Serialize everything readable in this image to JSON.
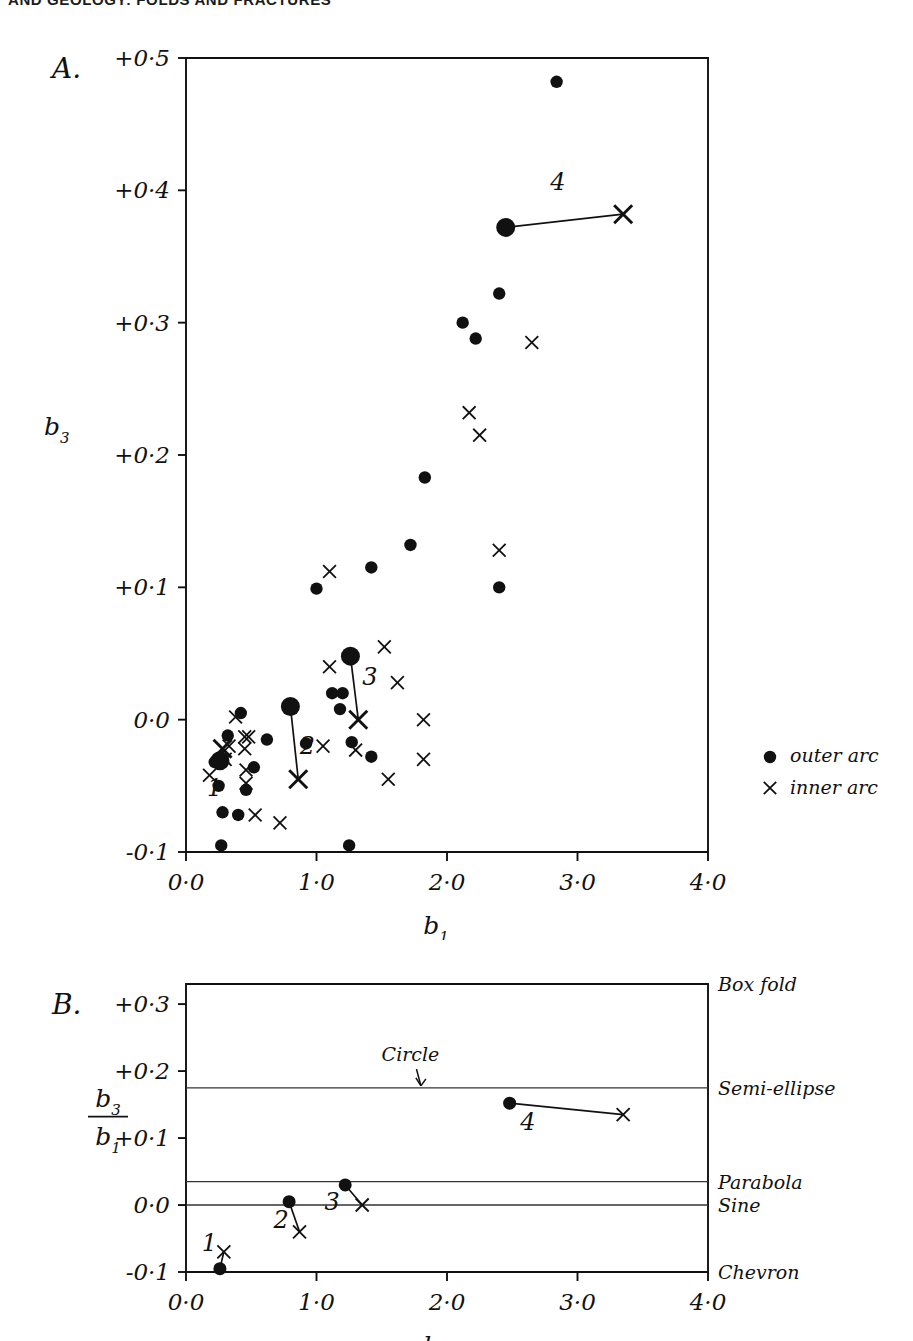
{
  "running_head": "AND GEOLOGY: FOLDS AND FRACTURES",
  "panelA": {
    "label": "A.",
    "ylabel": "b",
    "ylabel_sub": "3",
    "xlabel": "b",
    "xlabel_sub": "1",
    "yticks": [
      "+0·5",
      "+0·4",
      "+0·3",
      "+0·2",
      "+0·1",
      "0·0",
      "-0·1"
    ],
    "ytick_values": [
      0.5,
      0.4,
      0.3,
      0.2,
      0.1,
      0.0,
      -0.1
    ],
    "xticks": [
      "0·0",
      "1·0",
      "2·0",
      "3·0",
      "4·0"
    ],
    "xtick_values": [
      0.0,
      1.0,
      2.0,
      3.0,
      4.0
    ],
    "legend": [
      {
        "marker": "dot",
        "label": "outer arc"
      },
      {
        "marker": "cross",
        "label": "inner arc"
      }
    ],
    "pair_labels": [
      "1",
      "2",
      "3",
      "4"
    ]
  },
  "panelB": {
    "label": "B.",
    "ylabel_num": "b",
    "ylabel_num_sub": "3",
    "ylabel_den": "b",
    "ylabel_den_sub": "1",
    "xlabel": "b",
    "xlabel_sub": "1",
    "yticks": [
      "+0·3",
      "+0·2",
      "+0·1",
      "0·0",
      "-0·1"
    ],
    "ytick_values": [
      0.3,
      0.2,
      0.1,
      0.0,
      -0.1
    ],
    "xticks": [
      "0·0",
      "1·0",
      "2·0",
      "3·0",
      "4·0"
    ],
    "xtick_values": [
      0.0,
      1.0,
      2.0,
      3.0,
      4.0
    ],
    "annotation": "Circle",
    "shape_labels": [
      "Box fold",
      "Semi-ellipse",
      "Parabola",
      "Sine",
      "Chevron"
    ],
    "pair_labels": [
      "1",
      "2",
      "3",
      "4"
    ]
  },
  "chart_data": [
    {
      "type": "scatter",
      "title": "A",
      "xlabel": "b1",
      "ylabel": "b3",
      "xlim": [
        0.0,
        4.0
      ],
      "ylim": [
        -0.1,
        0.5
      ],
      "grid": false,
      "legend_position": "right",
      "series": [
        {
          "name": "outer arc",
          "marker": "filled-circle",
          "points": [
            [
              2.84,
              0.482
            ],
            [
              2.4,
              0.322
            ],
            [
              2.12,
              0.3
            ],
            [
              2.22,
              0.288
            ],
            [
              1.83,
              0.183
            ],
            [
              1.72,
              0.132
            ],
            [
              1.42,
              0.115
            ],
            [
              1.0,
              0.099
            ],
            [
              2.4,
              0.1
            ],
            [
              1.12,
              0.02
            ],
            [
              1.2,
              0.02
            ],
            [
              1.18,
              0.008
            ],
            [
              0.42,
              0.005
            ],
            [
              0.32,
              -0.012
            ],
            [
              0.62,
              -0.015
            ],
            [
              0.92,
              -0.018
            ],
            [
              1.27,
              -0.017
            ],
            [
              1.42,
              -0.028
            ],
            [
              0.22,
              -0.032
            ],
            [
              0.52,
              -0.036
            ],
            [
              0.25,
              -0.05
            ],
            [
              0.46,
              -0.053
            ],
            [
              0.28,
              -0.07
            ],
            [
              0.4,
              -0.072
            ],
            [
              0.27,
              -0.095
            ],
            [
              1.25,
              -0.095
            ]
          ]
        },
        {
          "name": "inner arc",
          "marker": "x",
          "points": [
            [
              2.65,
              0.285
            ],
            [
              2.17,
              0.232
            ],
            [
              2.25,
              0.215
            ],
            [
              2.4,
              0.128
            ],
            [
              1.1,
              0.112
            ],
            [
              1.52,
              0.055
            ],
            [
              1.1,
              0.04
            ],
            [
              1.62,
              0.028
            ],
            [
              0.38,
              0.002
            ],
            [
              1.82,
              0.0
            ],
            [
              0.45,
              -0.013
            ],
            [
              0.48,
              -0.013
            ],
            [
              0.33,
              -0.02
            ],
            [
              0.45,
              -0.022
            ],
            [
              1.05,
              -0.02
            ],
            [
              1.3,
              -0.023
            ],
            [
              0.3,
              -0.03
            ],
            [
              1.82,
              -0.03
            ],
            [
              0.46,
              -0.038
            ],
            [
              0.18,
              -0.042
            ],
            [
              0.46,
              -0.048
            ],
            [
              1.55,
              -0.045
            ],
            [
              0.53,
              -0.072
            ],
            [
              0.72,
              -0.078
            ]
          ]
        }
      ],
      "tie_lines": [
        {
          "label": "1",
          "from": [
            0.26,
            -0.031
          ],
          "to": [
            0.28,
            -0.022
          ],
          "label_pos": [
            0.22,
            -0.058
          ]
        },
        {
          "label": "2",
          "from": [
            0.8,
            0.01
          ],
          "to": [
            0.86,
            -0.045
          ],
          "label_pos": [
            0.93,
            -0.026
          ]
        },
        {
          "label": "3",
          "from": [
            1.26,
            0.048
          ],
          "to": [
            1.32,
            0.0
          ],
          "label_pos": [
            1.41,
            0.026
          ]
        },
        {
          "label": "4",
          "from": [
            2.45,
            0.372
          ],
          "to": [
            3.35,
            0.382
          ],
          "label_pos": [
            2.85,
            0.4
          ]
        }
      ]
    },
    {
      "type": "scatter",
      "title": "B",
      "xlabel": "b1",
      "ylabel": "b3/b1",
      "xlim": [
        0.0,
        4.0
      ],
      "ylim": [
        -0.1,
        0.33
      ],
      "grid": false,
      "reference_lines": [
        {
          "label": "Box fold",
          "value": 0.33
        },
        {
          "label": "Semi-ellipse",
          "value": 0.175
        },
        {
          "label": "Parabola",
          "value": 0.035
        },
        {
          "label": "Sine",
          "value": 0.0
        },
        {
          "label": "Chevron",
          "value": -0.1
        }
      ],
      "annotations": [
        {
          "text": "Circle",
          "x": 1.72,
          "y": 0.215,
          "points_to": [
            1.8,
            0.175
          ]
        }
      ],
      "tie_lines": [
        {
          "label": "1",
          "from": [
            0.26,
            -0.095
          ],
          "to": [
            0.29,
            -0.07
          ],
          "label_pos": [
            0.18,
            -0.068
          ]
        },
        {
          "label": "2",
          "from": [
            0.79,
            0.005
          ],
          "to": [
            0.87,
            -0.04
          ],
          "label_pos": [
            0.73,
            -0.035
          ]
        },
        {
          "label": "3",
          "from": [
            1.22,
            0.03
          ],
          "to": [
            1.35,
            0.0
          ],
          "label_pos": [
            1.12,
            -0.008
          ]
        },
        {
          "label": "4",
          "from": [
            2.48,
            0.152
          ],
          "to": [
            3.35,
            0.135
          ],
          "label_pos": [
            2.62,
            0.112
          ]
        }
      ],
      "series": [
        {
          "name": "outer arc",
          "marker": "filled-circle",
          "points": [
            [
              0.26,
              -0.095
            ],
            [
              0.79,
              0.005
            ],
            [
              1.22,
              0.03
            ],
            [
              2.48,
              0.152
            ]
          ]
        },
        {
          "name": "inner arc",
          "marker": "x",
          "points": [
            [
              0.29,
              -0.07
            ],
            [
              0.87,
              -0.04
            ],
            [
              1.35,
              0.0
            ],
            [
              3.35,
              0.135
            ]
          ]
        }
      ]
    }
  ]
}
